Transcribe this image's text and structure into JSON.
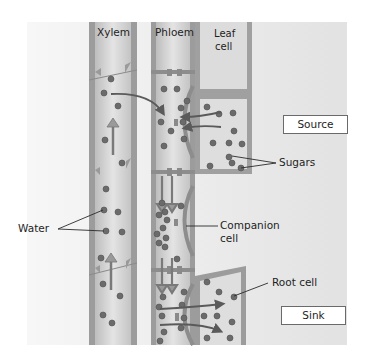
{
  "diagram": {
    "title": "",
    "labels": {
      "xylem": "Xylem",
      "phloem": "Phloem",
      "leaf_cell_line1": "Leaf",
      "leaf_cell_line2": "cell",
      "source": "Source",
      "sugars": "Sugars",
      "water": "Water",
      "companion_line1": "Companion",
      "companion_line2": "cell",
      "root_cell": "Root cell",
      "sink": "Sink"
    },
    "colors": {
      "background_panel": "#e9e9e9",
      "tube_wall": "#8f8f8f",
      "tube_fill": "#d6d6d6",
      "particle": "#6b6b6b",
      "arrow": "#5a5a5a",
      "label_text": "#1e1e1e"
    },
    "elements": [
      {
        "id": "xylem",
        "type": "tube",
        "label": "Xylem"
      },
      {
        "id": "phloem",
        "type": "tube",
        "label": "Phloem"
      },
      {
        "id": "leaf-cell",
        "type": "cell",
        "label": "Leaf cell"
      },
      {
        "id": "source-cell",
        "type": "cell"
      },
      {
        "id": "companion-cell",
        "type": "cell",
        "label": "Companion cell"
      },
      {
        "id": "root-cell",
        "type": "cell",
        "label": "Root cell"
      }
    ],
    "callouts": [
      {
        "label": "Water",
        "targets": [
          "xylem"
        ]
      },
      {
        "label": "Sugars",
        "targets": [
          "source-cell"
        ]
      },
      {
        "label": "Companion cell",
        "targets": [
          "companion-cell"
        ]
      },
      {
        "label": "Root cell",
        "targets": [
          "root-cell"
        ]
      }
    ],
    "region_boxes": [
      {
        "label": "Source"
      },
      {
        "label": "Sink"
      }
    ]
  }
}
